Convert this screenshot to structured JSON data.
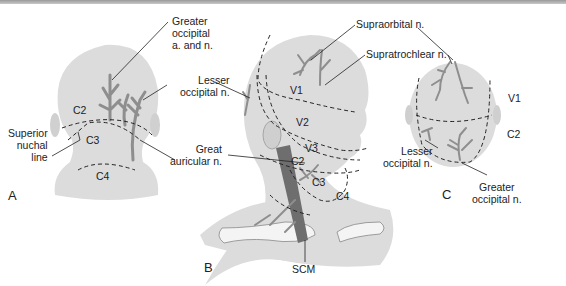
{
  "figure": {
    "panels": [
      {
        "id": "A",
        "label": "A"
      },
      {
        "id": "B",
        "label": "B"
      },
      {
        "id": "C",
        "label": "C"
      }
    ],
    "panel_a": {
      "labels": {
        "greater_occipital": [
          "Greater",
          "occipital",
          "a. and n."
        ],
        "superior_nuchal": [
          "Superior",
          "nuchal",
          "line"
        ]
      },
      "zones": [
        "C2",
        "C3",
        "C4"
      ]
    },
    "panel_b": {
      "labels": {
        "lesser_occipital": [
          "Lesser",
          "occipital n."
        ],
        "great_auricular": [
          "Great",
          "auricular n."
        ],
        "supraorbital": "Supraorbital n.",
        "supratrochlear": "Supratrochlear n.",
        "scm": "SCM"
      },
      "zones": [
        "V1",
        "V2",
        "V3",
        "C2",
        "C3",
        "C4"
      ]
    },
    "panel_c": {
      "labels": {
        "lesser_occipital": [
          "Lesser",
          "occipital n."
        ],
        "greater_occipital": [
          "Greater",
          "occipital n."
        ]
      },
      "zones": [
        "V1",
        "C2"
      ]
    },
    "colors": {
      "skin": "#dcdcdc",
      "nerve": "#8e8e8e",
      "muscle": "#6e6e6e",
      "line": "#222222",
      "bone": "#f4f4f4"
    }
  }
}
